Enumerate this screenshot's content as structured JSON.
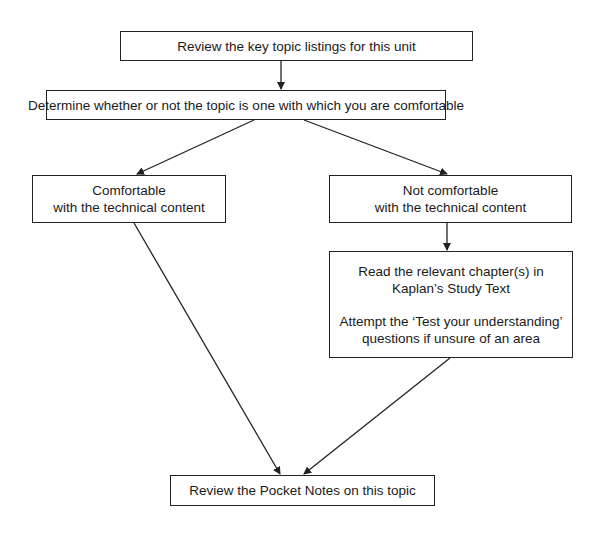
{
  "diagram": {
    "type": "flowchart",
    "nodes": [
      {
        "id": "review_topics",
        "lines": [
          "Review the key topic listings for this unit"
        ]
      },
      {
        "id": "determine",
        "lines": [
          "Determine whether or not the topic is one with which you are comfortable"
        ]
      },
      {
        "id": "comfortable",
        "lines": [
          "Comfortable",
          "with the technical content"
        ]
      },
      {
        "id": "not_comfortable",
        "lines": [
          "Not comfortable",
          "with the technical content"
        ]
      },
      {
        "id": "read_chapters",
        "paragraphs": [
          [
            "Read the relevant chapter(s) in",
            "Kaplan’s Study Text"
          ],
          [
            "Attempt the ‘Test your understanding’",
            "questions if unsure of an area"
          ]
        ]
      },
      {
        "id": "pocket_notes",
        "lines": [
          "Review the Pocket Notes on this topic"
        ]
      }
    ],
    "edges": [
      {
        "from": "review_topics",
        "to": "determine"
      },
      {
        "from": "determine",
        "to": "comfortable"
      },
      {
        "from": "determine",
        "to": "not_comfortable"
      },
      {
        "from": "not_comfortable",
        "to": "read_chapters"
      },
      {
        "from": "comfortable",
        "to": "pocket_notes"
      },
      {
        "from": "read_chapters",
        "to": "pocket_notes"
      }
    ],
    "colors": {
      "stroke": "#222222",
      "background": "#ffffff",
      "text": "#1a1a1a"
    }
  }
}
